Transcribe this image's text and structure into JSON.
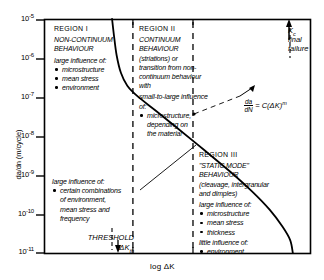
{
  "chart_data": {
    "type": "line",
    "title": "",
    "xlabel": "log ΔK",
    "ylabel": "da/dn  (m/cycle)",
    "ytick_labels": [
      "10-5",
      "10-6",
      "10-7",
      "10-8",
      "10-9",
      "10-10",
      "10-11"
    ],
    "ytick_mantissa": "10",
    "ytick_exponents": [
      "-5",
      "-6",
      "-7",
      "-8",
      "-9",
      "-10",
      "-11"
    ],
    "ylim": [
      "1e-11",
      "1e-5"
    ],
    "grid": false,
    "legend": "none",
    "series": [
      {
        "name": "fatigue crack growth rate",
        "description": "sigmoidal da/dN vs log(delta K) curve",
        "points": [
          [
            0.255,
            1.0
          ],
          [
            0.262,
            0.93
          ],
          [
            0.272,
            0.845
          ],
          [
            0.288,
            0.77
          ],
          [
            0.312,
            0.715
          ],
          [
            0.352,
            0.668
          ],
          [
            0.42,
            0.607
          ],
          [
            0.5,
            0.533
          ],
          [
            0.6,
            0.44
          ],
          [
            0.7,
            0.345
          ],
          [
            0.78,
            0.262
          ],
          [
            0.845,
            0.185
          ],
          [
            0.893,
            0.113
          ],
          [
            0.922,
            0.055
          ],
          [
            0.932,
            0.0
          ]
        ]
      }
    ],
    "annotations": {
      "threshold": "THRESHOLD",
      "threshold_symbol": "ΔK",
      "threshold_subscript": "th",
      "kc_symbol": "K",
      "kc_subscript": "c",
      "kc_text_1": "final",
      "kc_text_2": "failure",
      "paris_num": "da",
      "paris_den": "dN",
      "paris_rhs": "= C(ΔK)",
      "paris_exponent": "m",
      "divider_1_x": 0.333,
      "divider_2_x": 0.558
    }
  },
  "regions": {
    "region1": {
      "header": "REGION I",
      "title_line1": "NON-CONTINUUM",
      "title_line2": "BEHAVIOUR",
      "influence_header": "large influence of:",
      "bullets": [
        "microstructure",
        "mean stress",
        "environment"
      ]
    },
    "region2": {
      "header": "REGION II",
      "title_line1": "CONTINUUM",
      "title_line2": "BEHAVIOUR",
      "body_lines": [
        "(striations) or",
        "transition from non-",
        "continuum behaviour",
        "with"
      ],
      "influence_header_line1": "small-to-large influence",
      "influence_header_line2": "of:",
      "bullets": [
        "microstructure,"
      ],
      "bullet_cont_lines": [
        "depending on",
        "the material"
      ]
    },
    "region2b": {
      "influence_header": "large influence of:",
      "bullets": [
        "certain combinations"
      ],
      "bullet_cont_lines": [
        "of environment,",
        "mean stress and",
        "frequency"
      ]
    },
    "region3": {
      "header": "REGION III",
      "title_line1": "\"STATIC MODE\"",
      "title_line2": "BEHAVIOUR",
      "body_lines": [
        "(cleavage, intergranular",
        "and dimples)"
      ],
      "influence_header": "large influence of:",
      "bullets": [
        "microstructure",
        "mean stress",
        "thickness"
      ],
      "little_header": "little influence of:",
      "little_bullets": [
        "environment"
      ]
    }
  }
}
